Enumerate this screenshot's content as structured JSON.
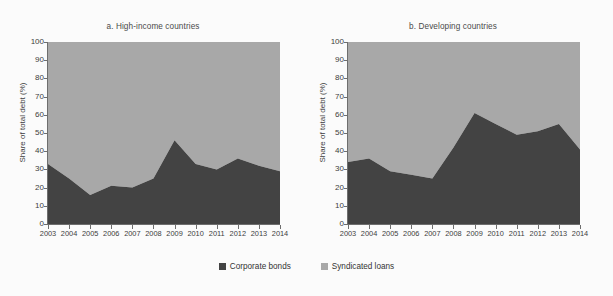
{
  "figure": {
    "background": "#fbfbfb",
    "legend": {
      "position": "bottom-center",
      "items": [
        {
          "label": "Corporate bonds",
          "color": "#434343",
          "icon": "square-swatch-icon"
        },
        {
          "label": "Syndicated loans",
          "color": "#a8a8a8",
          "icon": "square-swatch-icon"
        }
      ]
    }
  },
  "chart_data": [
    {
      "type": "area",
      "stacked": true,
      "panel_id": "a",
      "title": "a. High-income countries",
      "xlabel": "",
      "ylabel": "Share of total debt (%)",
      "ylim": [
        0,
        100
      ],
      "yticks": [
        0,
        10,
        20,
        30,
        40,
        50,
        60,
        70,
        80,
        90,
        100
      ],
      "ytick_labels": [
        "0",
        "10",
        "20",
        "30",
        "40",
        "50",
        "60",
        "70",
        "80",
        "90",
        "100"
      ],
      "grid": false,
      "x": [
        "2003",
        "2004",
        "2005",
        "2006",
        "2007",
        "2008",
        "2009",
        "2010",
        "2011",
        "2012",
        "2013",
        "2014"
      ],
      "series": [
        {
          "name": "Corporate bonds",
          "color": "#434343",
          "values": [
            33,
            25,
            16,
            21,
            20,
            25,
            46,
            33,
            30,
            36,
            32,
            29
          ]
        },
        {
          "name": "Syndicated loans",
          "color": "#a8a8a8",
          "values": [
            67,
            75,
            84,
            79,
            80,
            75,
            54,
            67,
            70,
            64,
            68,
            71
          ]
        }
      ]
    },
    {
      "type": "area",
      "stacked": true,
      "panel_id": "b",
      "title": "b. Developing countries",
      "xlabel": "",
      "ylabel": "Share of total debt (%)",
      "ylim": [
        0,
        100
      ],
      "yticks": [
        0,
        10,
        20,
        30,
        40,
        50,
        60,
        70,
        80,
        90,
        100
      ],
      "ytick_labels": [
        "0",
        "10",
        "20",
        "30",
        "40",
        "50",
        "60",
        "70",
        "80",
        "90",
        "100"
      ],
      "grid": false,
      "x": [
        "2003",
        "2004",
        "2005",
        "2006",
        "2007",
        "2008",
        "2009",
        "2010",
        "2011",
        "2012",
        "2013",
        "2014"
      ],
      "series": [
        {
          "name": "Corporate bonds",
          "color": "#434343",
          "values": [
            34,
            36,
            29,
            27,
            25,
            42,
            61,
            55,
            49,
            51,
            55,
            41
          ]
        },
        {
          "name": "Syndicated loans",
          "color": "#a8a8a8",
          "values": [
            66,
            64,
            71,
            73,
            75,
            58,
            39,
            45,
            51,
            49,
            45,
            59
          ]
        }
      ]
    }
  ]
}
